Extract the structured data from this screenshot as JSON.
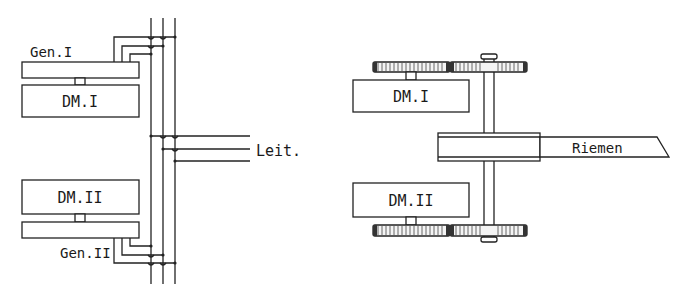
{
  "diagram": {
    "left": {
      "title": "Generator / motor wiring",
      "units": [
        {
          "id": "gen1",
          "label": "Gen.I"
        },
        {
          "id": "dm1",
          "label": "DM.I"
        },
        {
          "id": "dm2",
          "label": "DM.II"
        },
        {
          "id": "gen2",
          "label": "Gen.II"
        }
      ],
      "bus_label": "Leit."
    },
    "right": {
      "title": "Belt drive arrangement",
      "units": [
        {
          "id": "dm1",
          "label": "DM.I"
        },
        {
          "id": "dm2",
          "label": "DM.II"
        }
      ],
      "belt_label": "Riemen"
    },
    "colors": {
      "line": "#222222",
      "background": "#ffffff"
    }
  }
}
